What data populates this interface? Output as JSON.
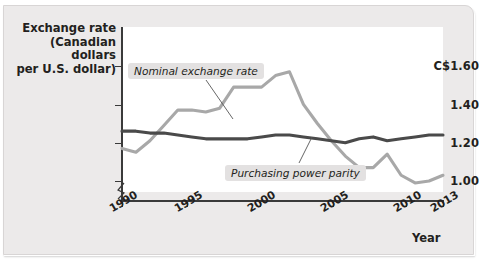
{
  "chart_data": {
    "type": "line",
    "title": "",
    "ylabel": "Exchange rate (Canadian dollars per U.S. dollar)",
    "ylabel_lines": [
      "Exchange rate",
      "(Canadian dollars",
      "per U.S. dollar)"
    ],
    "xlabel": "Year",
    "ylim": [
      0.92,
      1.66
    ],
    "xlim": [
      1990,
      2013
    ],
    "grid": false,
    "legend_position": "inline-callouts",
    "y_ticks": [
      {
        "value": 1.6,
        "label": "C$1.60"
      },
      {
        "value": 1.4,
        "label": "1.40"
      },
      {
        "value": 1.2,
        "label": "1.20"
      },
      {
        "value": 1.0,
        "label": "1.00"
      }
    ],
    "x_ticks": [
      {
        "value": 1990,
        "label": "1990"
      },
      {
        "value": 1995,
        "label": "1995"
      },
      {
        "value": 2000,
        "label": "2000"
      },
      {
        "value": 2005,
        "label": "2005"
      },
      {
        "value": 2010,
        "label": "2010"
      },
      {
        "value": 2013,
        "label": "2013"
      }
    ],
    "axis_break": true,
    "x": [
      1990,
      1991,
      1992,
      1993,
      1994,
      1995,
      1996,
      1997,
      1998,
      1999,
      2000,
      2001,
      2002,
      2003,
      2004,
      2005,
      2006,
      2007,
      2008,
      2009,
      2010,
      2011,
      2012,
      2013
    ],
    "series": [
      {
        "name": "Nominal exchange rate",
        "color": "#a8a8a8",
        "values": [
          1.17,
          1.15,
          1.21,
          1.29,
          1.37,
          1.37,
          1.36,
          1.38,
          1.49,
          1.49,
          1.49,
          1.55,
          1.57,
          1.4,
          1.3,
          1.21,
          1.13,
          1.07,
          1.07,
          1.14,
          1.03,
          0.99,
          1.0,
          1.03
        ]
      },
      {
        "name": "Purchasing power parity",
        "color": "#4a4a4a",
        "values": [
          1.26,
          1.26,
          1.25,
          1.25,
          1.24,
          1.23,
          1.22,
          1.22,
          1.22,
          1.22,
          1.23,
          1.24,
          1.24,
          1.23,
          1.22,
          1.21,
          1.2,
          1.22,
          1.23,
          1.21,
          1.22,
          1.23,
          1.24,
          1.24
        ]
      }
    ],
    "annotations": [
      {
        "id": "nominal-callout",
        "text": "Nominal exchange rate"
      },
      {
        "id": "ppp-callout",
        "text": "Purchasing power parity"
      }
    ]
  }
}
